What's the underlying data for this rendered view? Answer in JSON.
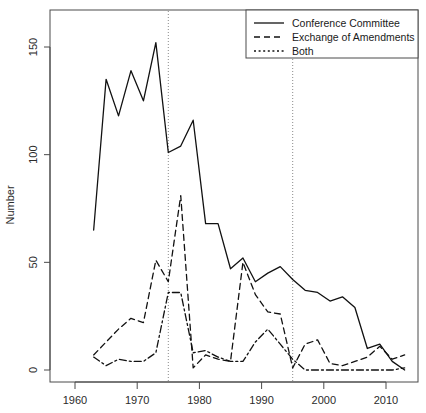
{
  "chart_data": {
    "type": "line",
    "title": "",
    "xlabel": "",
    "ylabel": "Number",
    "xlim": [
      1961,
      2014
    ],
    "ylim": [
      -5,
      168
    ],
    "grid": false,
    "legend_position": "top-right",
    "x_ticks": [
      1960,
      1970,
      1980,
      1990,
      2000,
      2010
    ],
    "x_tick_labels": [
      "1960",
      "1970",
      "1980",
      "1990",
      "2000",
      "2010"
    ],
    "y_ticks": [
      0,
      50,
      100,
      150
    ],
    "y_tick_labels": [
      "0",
      "50",
      "100",
      "150"
    ],
    "annotations": [
      {
        "type": "vline",
        "x": 1975,
        "style": "dotted"
      },
      {
        "type": "vline",
        "x": 1995,
        "style": "dotted"
      }
    ],
    "x": [
      1963,
      1965,
      1967,
      1969,
      1971,
      1973,
      1975,
      1977,
      1979,
      1981,
      1983,
      1985,
      1987,
      1989,
      1991,
      1993,
      1995,
      1997,
      1999,
      2001,
      2003,
      2005,
      2007,
      2009,
      2011,
      2013
    ],
    "series": [
      {
        "name": "Conference Committee",
        "style": "solid",
        "values": [
          65,
          135,
          118,
          139,
          125,
          152,
          101,
          104,
          116,
          68,
          68,
          47,
          52,
          41,
          45,
          48,
          42,
          37,
          36,
          32,
          34,
          29,
          10,
          12,
          4,
          0
        ]
      },
      {
        "name": "Exchange of Amendments",
        "style": "dashed",
        "values": [
          7,
          13,
          19,
          24,
          22,
          51,
          41,
          81,
          1,
          7,
          5,
          4,
          50,
          35,
          27,
          26,
          1,
          12,
          14,
          3,
          2,
          4,
          6,
          11,
          5,
          7
        ]
      },
      {
        "name": "Both",
        "style": "dotted",
        "values": [
          6,
          2,
          5,
          4,
          4,
          8,
          36,
          36,
          8,
          9,
          6,
          4,
          4,
          13,
          19,
          12,
          5,
          0,
          0,
          0,
          0,
          0,
          0,
          0,
          0,
          1
        ]
      }
    ]
  },
  "legend": {
    "entries": [
      {
        "label": "Conference Committee",
        "style": "solid"
      },
      {
        "label": "Exchange of Amendments",
        "style": "dashed"
      },
      {
        "label": "Both",
        "style": "dotted"
      }
    ]
  }
}
